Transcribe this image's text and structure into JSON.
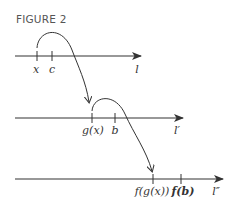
{
  "figure": {
    "title": "FIGURE 2",
    "colors": {
      "line": "#333333",
      "text": "#333333",
      "title": "#555555"
    },
    "lines": [
      {
        "name": "l",
        "label": "l",
        "ticks": [
          {
            "label": "x"
          },
          {
            "label": "c"
          }
        ]
      },
      {
        "name": "l-prime",
        "label": "l′",
        "ticks": [
          {
            "label": "g(x)"
          },
          {
            "label": "b"
          }
        ]
      },
      {
        "name": "l-double-prime",
        "label": "l″",
        "ticks": [
          {
            "label": "f(g(x))"
          },
          {
            "label": "f(b)"
          }
        ]
      }
    ],
    "mappings": [
      {
        "from": "x",
        "to": "g(x)",
        "function": "g"
      },
      {
        "from": "g(x)",
        "to": "f(g(x))",
        "function": "f"
      }
    ]
  }
}
